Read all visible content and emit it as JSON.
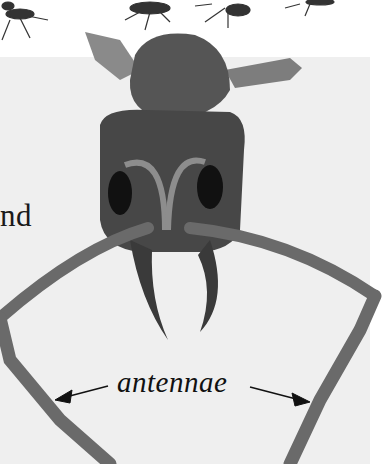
{
  "illustration": {
    "subject": "ant-head-front-view",
    "partial_text": "nd",
    "label": "antennae",
    "colors": {
      "background": "#ffffff",
      "panel": "#efefef",
      "head": "#4a4a4a",
      "text": "#111111"
    }
  }
}
